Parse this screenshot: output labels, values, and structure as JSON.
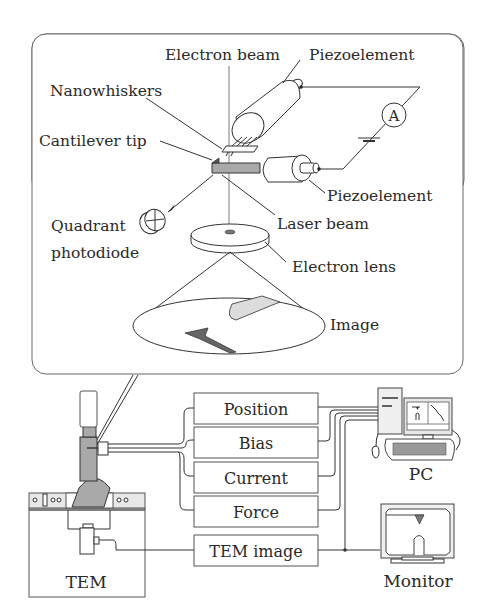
{
  "figure": {
    "inset": {
      "labels": {
        "electron_beam": "Electron beam",
        "piezoelement_top": "Piezoelement",
        "nanowhiskers": "Nanowhiskers",
        "cantilever_tip": "Cantilever tip",
        "piezoelement_bottom": "Piezoelement",
        "quadrant_photodiode_line1": "Quadrant",
        "quadrant_photodiode_line2": "photodiode",
        "laser_beam": "Laser beam",
        "electron_lens": "Electron lens",
        "image": "Image",
        "ammeter": "A"
      }
    },
    "signal_boxes": [
      {
        "label": "Position"
      },
      {
        "label": "Bias"
      },
      {
        "label": "Current"
      },
      {
        "label": "Force"
      },
      {
        "label": "TEM image"
      }
    ],
    "devices": {
      "tem": "TEM",
      "pc": "PC",
      "monitor": "Monitor"
    },
    "colors": {
      "line": "#333333",
      "shaded": "#a9a9a9",
      "light_shade": "#d6d6d6",
      "background": "#ffffff"
    }
  }
}
